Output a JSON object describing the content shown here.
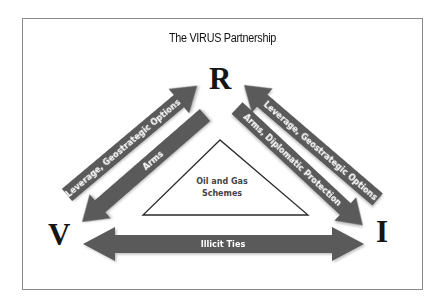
{
  "title": "The VIRUS Partnership",
  "nodes": {
    "top": "R",
    "left": "V",
    "right": "I"
  },
  "arrows": {
    "r_to_v_leverage": {
      "label": "Leverage, Geostrategic Options",
      "direction": "V to R"
    },
    "r_to_v_arms": {
      "label": "Arms",
      "direction": "R to V"
    },
    "r_to_i_leverage": {
      "label": "Leverage, Geostrategic Options",
      "direction": "I to R"
    },
    "r_to_i_arms": {
      "label": "Arms, Diplomatic Protection",
      "direction": "R to I"
    },
    "v_i_illicit": {
      "label": "Illicit Ties",
      "direction": "bidirectional V-I"
    }
  },
  "center": {
    "line1": "Oil and Gas",
    "line2": "Schemes"
  },
  "colors": {
    "arrow_fill": "#5a5a5a",
    "frame_border": "#8a8a8a",
    "node_text": "#151515"
  }
}
